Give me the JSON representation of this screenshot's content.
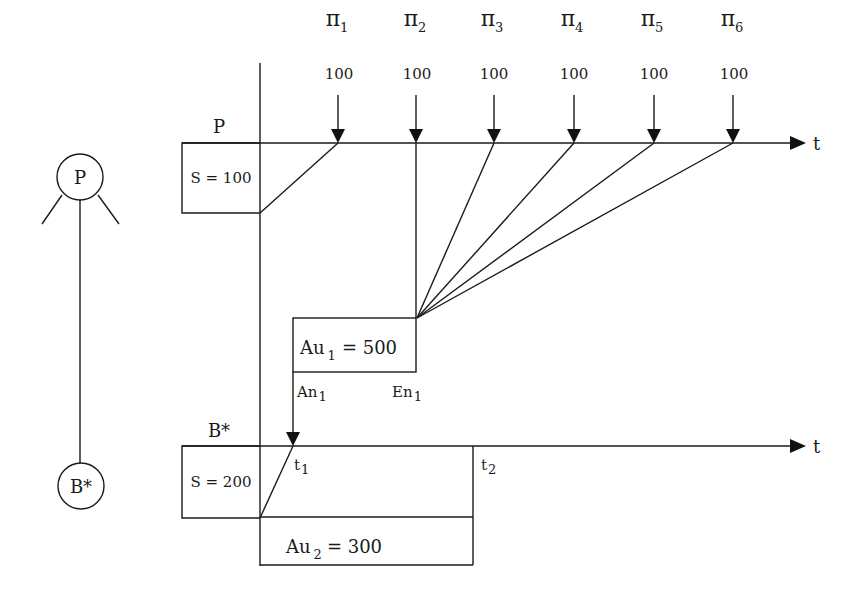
{
  "tree": {
    "root_node": "P",
    "leaf_node": "B*"
  },
  "upper_timeline": {
    "label": "P",
    "axis_label": "t",
    "stock_box": "S = 100",
    "arrivals": [
      {
        "symbol": "π",
        "index": "1",
        "value": "100"
      },
      {
        "symbol": "π",
        "index": "2",
        "value": "100"
      },
      {
        "symbol": "π",
        "index": "3",
        "value": "100"
      },
      {
        "symbol": "π",
        "index": "4",
        "value": "100"
      },
      {
        "symbol": "π",
        "index": "5",
        "value": "100"
      },
      {
        "symbol": "π",
        "index": "6",
        "value": "100"
      }
    ]
  },
  "order_box": {
    "prefix": "Au",
    "index": "1",
    "value": "= 500",
    "start_label": "An",
    "start_index": "1",
    "end_label": "En",
    "end_index": "1"
  },
  "lower_timeline": {
    "label": "B*",
    "axis_label": "t",
    "stock_box": "S = 200",
    "t1_label": "t",
    "t1_index": "1",
    "t2_label": "t",
    "t2_index": "2"
  },
  "order_box_2": {
    "prefix": "Au",
    "index": "2",
    "value": "= 300"
  }
}
